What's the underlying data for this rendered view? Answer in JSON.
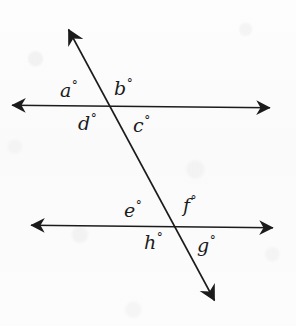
{
  "figure": {
    "type": "geometry-diagram",
    "background_color": "#fcfcfc",
    "ink_color": "#1b1b1b",
    "lines": [
      {
        "name": "top-parallel-line",
        "x1": 8,
        "y1": 105,
        "x2": 274,
        "y2": 108,
        "arrow_start": true,
        "arrow_end": true
      },
      {
        "name": "bottom-parallel-line",
        "x1": 27,
        "y1": 225,
        "x2": 277,
        "y2": 228,
        "arrow_start": true,
        "arrow_end": true
      },
      {
        "name": "transversal-line",
        "x1": 64,
        "y1": 22,
        "x2": 219,
        "y2": 309,
        "arrow_start": true,
        "arrow_end": true
      }
    ],
    "intersections": [
      {
        "name": "upper-intersection",
        "x": 108,
        "y": 106
      },
      {
        "name": "lower-intersection",
        "x": 175,
        "y": 226
      }
    ],
    "labels": [
      {
        "id": "a",
        "letter": "a",
        "degree": "°",
        "x": 60,
        "y": 80,
        "position": "upper-left-above"
      },
      {
        "id": "b",
        "letter": "b",
        "degree": "°",
        "x": 114,
        "y": 78,
        "position": "upper-right-above"
      },
      {
        "id": "d",
        "letter": "d",
        "degree": "°",
        "x": 78,
        "y": 113,
        "position": "upper-left-below"
      },
      {
        "id": "c",
        "letter": "c",
        "degree": "°",
        "x": 133,
        "y": 115,
        "position": "upper-right-below"
      },
      {
        "id": "e",
        "letter": "e",
        "degree": "°",
        "x": 124,
        "y": 200,
        "position": "lower-left-above"
      },
      {
        "id": "f",
        "letter": "f",
        "degree": "°",
        "x": 183,
        "y": 195,
        "position": "lower-right-above"
      },
      {
        "id": "h",
        "letter": "h",
        "degree": "°",
        "x": 144,
        "y": 232,
        "position": "lower-left-below"
      },
      {
        "id": "g",
        "letter": "g",
        "degree": "°",
        "x": 197,
        "y": 235,
        "position": "lower-right-below"
      }
    ]
  }
}
